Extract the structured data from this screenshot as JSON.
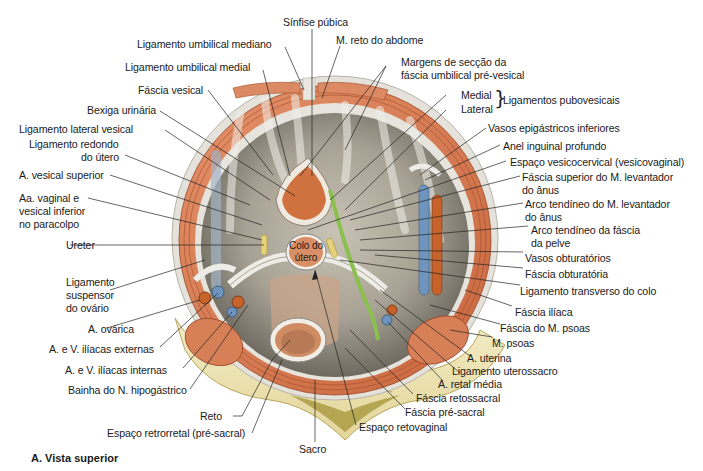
{
  "caption": "A. Vista superior",
  "colors": {
    "background": "#ffffff",
    "muscle": "#d9805a",
    "muscle_dark": "#b5532e",
    "fascia": "#d8d6ce",
    "peritoneum_cavity": "#9f9a8f",
    "bone": "#efe6b8",
    "bone_dark": "#c9b66a",
    "artery": "#c7622b",
    "vein": "#6f95bf",
    "nerve_sheath": "#8bc04f",
    "ureter": "#e6d27a",
    "label_text": "#1a1a1a",
    "leader_line": "#222222"
  },
  "labels": {
    "top": [
      {
        "id": "sinfise",
        "text": "Sínfise púbica"
      },
      {
        "id": "lig_umb_mediano",
        "text": "Ligamento umbilical mediano"
      },
      {
        "id": "m_reto",
        "text": "M. reto do abdome"
      },
      {
        "id": "lig_umb_medial",
        "text": "Ligamento umbilical medial"
      },
      {
        "id": "margens_1",
        "text": "Margens de secção da"
      },
      {
        "id": "margens_2",
        "text": "fáscia umbilical pré-vesical"
      }
    ],
    "left": [
      {
        "id": "fascia_vesical",
        "text": "Fáscia vesical"
      },
      {
        "id": "bexiga",
        "text": "Bexiga urinária"
      },
      {
        "id": "lig_lat_vesical",
        "text": "Ligamento lateral vesical"
      },
      {
        "id": "lig_redondo_1",
        "text": "Ligamento redondo"
      },
      {
        "id": "lig_redondo_2",
        "text": "do útero"
      },
      {
        "id": "a_vesical_sup",
        "text": "A. vesical superior"
      },
      {
        "id": "aa_vaginal_1",
        "text": "Aa. vaginal e"
      },
      {
        "id": "aa_vaginal_2",
        "text": "vesical inferior"
      },
      {
        "id": "aa_vaginal_3",
        "text": "no paracolpo"
      },
      {
        "id": "ureter",
        "text": "Ureter"
      },
      {
        "id": "lig_susp_1",
        "text": "Ligamento"
      },
      {
        "id": "lig_susp_2",
        "text": "suspensor"
      },
      {
        "id": "lig_susp_3",
        "text": "do ovário"
      },
      {
        "id": "a_ovarica",
        "text": "A. ovárica"
      },
      {
        "id": "iliacas_ext",
        "text": "A. e V. ilíacas externas"
      },
      {
        "id": "iliacas_int",
        "text": "A. e V. ilíacas internas"
      },
      {
        "id": "bainha_hipog",
        "text": "Bainha do N. hipogástrico"
      }
    ],
    "right": [
      {
        "id": "medial",
        "text": "Medial"
      },
      {
        "id": "lateral",
        "text": "Lateral"
      },
      {
        "id": "lig_pubovesicais",
        "text": "Ligamentos pubovesicais"
      },
      {
        "id": "vasos_epig",
        "text": "Vasos epigástricos inferiores"
      },
      {
        "id": "anel_inguinal",
        "text": "Anel inguinal profundo"
      },
      {
        "id": "espaco_vesicocerv",
        "text": "Espaço vesicocervical (vesicovaginal)"
      },
      {
        "id": "fascia_sup_lev_1",
        "text": "Fáscia superior do M. levantador"
      },
      {
        "id": "fascia_sup_lev_2",
        "text": "do ânus"
      },
      {
        "id": "arco_lev_1",
        "text": "Arco tendíneo do M. levantador"
      },
      {
        "id": "arco_lev_2",
        "text": "do ânus"
      },
      {
        "id": "arco_fascia_1",
        "text": "Arco tendíneo da fáscia"
      },
      {
        "id": "arco_fascia_2",
        "text": "da pelve"
      },
      {
        "id": "vasos_obt",
        "text": "Vasos obturatórios"
      },
      {
        "id": "fascia_obt",
        "text": "Fáscia obturatória"
      },
      {
        "id": "lig_transv",
        "text": "Ligamento transverso do colo"
      },
      {
        "id": "fascia_iliaca",
        "text": "Fáscia ilíaca"
      },
      {
        "id": "fascia_psoas",
        "text": "Fáscia do M. psoas"
      },
      {
        "id": "m_psoas",
        "text": "M. psoas"
      },
      {
        "id": "a_uterina",
        "text": "A. uterina"
      },
      {
        "id": "lig_uterossacro",
        "text": "Ligamento uterossacro"
      },
      {
        "id": "a_retal_media",
        "text": "A. retal média"
      },
      {
        "id": "fascia_retossacral",
        "text": "Fáscia retossacral"
      },
      {
        "id": "fascia_presacral",
        "text": "Fáscia pré-sacral"
      }
    ],
    "bottom": [
      {
        "id": "espaco_retovag",
        "text": "Espaço retovaginal"
      },
      {
        "id": "reto",
        "text": "Reto"
      },
      {
        "id": "espaco_retrorretal",
        "text": "Espaço retrorretal (pré-sacral)"
      },
      {
        "id": "sacro",
        "text": "Sacro"
      }
    ],
    "center": [
      {
        "id": "colo_1",
        "text": "Colo do"
      },
      {
        "id": "colo_2",
        "text": "útero"
      }
    ]
  }
}
